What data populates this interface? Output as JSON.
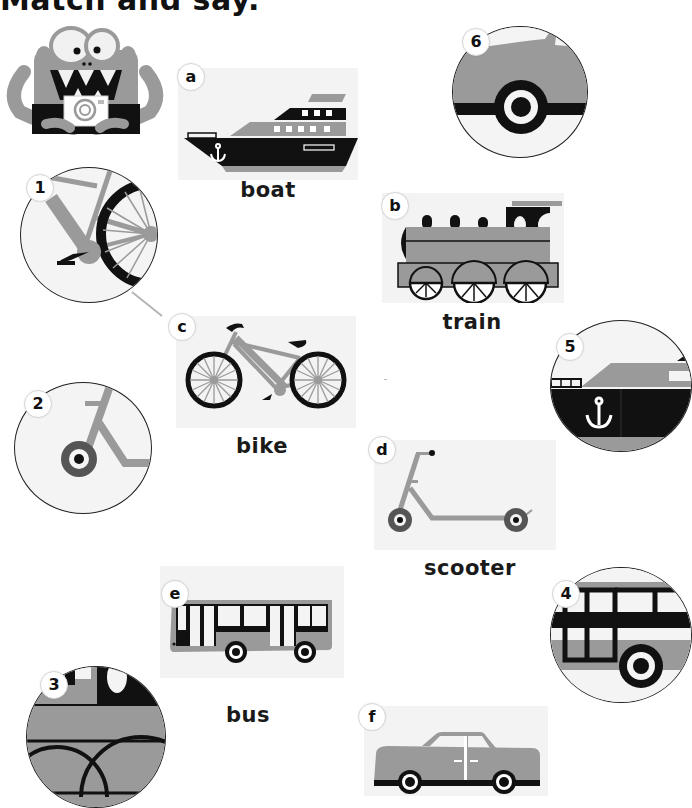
{
  "page": {
    "title": "Match and say.",
    "instruction_line_color": "#b5b5b5"
  },
  "colors": {
    "gray": "#9a9a9a",
    "black": "#111111",
    "card_bg": "#f3f3f3",
    "circle_bg": "#f4f4f4"
  },
  "pictures": [
    {
      "letter": "a",
      "word": "boat",
      "icon": "boat-icon"
    },
    {
      "letter": "b",
      "word": "train",
      "icon": "train-icon"
    },
    {
      "letter": "c",
      "word": "bike",
      "icon": "bike-icon"
    },
    {
      "letter": "d",
      "word": "scooter",
      "icon": "scooter-icon"
    },
    {
      "letter": "e",
      "word": "bus",
      "icon": "bus-icon"
    },
    {
      "letter": "f",
      "word": "",
      "icon": "car-icon"
    }
  ],
  "details": [
    {
      "number": "1",
      "depicts": "bike-detail-icon"
    },
    {
      "number": "2",
      "depicts": "scooter-detail-icon"
    },
    {
      "number": "3",
      "depicts": "train-detail-icon"
    },
    {
      "number": "4",
      "depicts": "bus-detail-icon"
    },
    {
      "number": "5",
      "depicts": "boat-detail-icon"
    },
    {
      "number": "6",
      "depicts": "car-detail-icon"
    }
  ],
  "example_match": {
    "from": "1",
    "to": "c"
  }
}
